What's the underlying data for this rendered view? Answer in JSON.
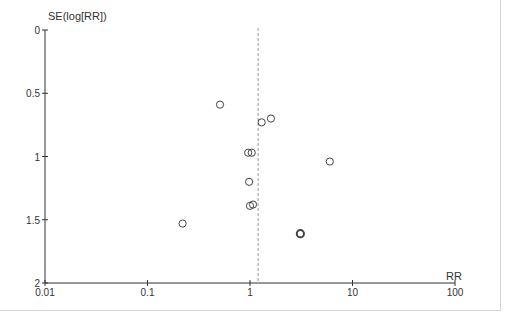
{
  "chart_data": {
    "type": "scatter",
    "subtype": "funnel_plot",
    "title": "",
    "xlabel": "RR",
    "ylabel": "SE(log[RR])",
    "xscale": "log",
    "xlim": [
      0.01,
      100
    ],
    "ylim": [
      2,
      0
    ],
    "y_inverted": true,
    "xticks": [
      0.01,
      0.1,
      1,
      10,
      100
    ],
    "xtick_labels": [
      "0.01",
      "0.1",
      "1",
      "10",
      "100"
    ],
    "yticks": [
      0,
      0.5,
      1,
      1.5,
      2
    ],
    "ytick_labels": [
      "0",
      "0.5",
      "1",
      "1.5",
      "2"
    ],
    "grid": false,
    "legend": null,
    "reference_line": {
      "style": "dashed",
      "x": 1.2,
      "color": "#9a9a9a"
    },
    "points": [
      {
        "x": 0.51,
        "y": 0.59
      },
      {
        "x": 1.3,
        "y": 0.73
      },
      {
        "x": 1.6,
        "y": 0.7
      },
      {
        "x": 0.96,
        "y": 0.97
      },
      {
        "x": 1.04,
        "y": 0.97
      },
      {
        "x": 6.0,
        "y": 1.04
      },
      {
        "x": 0.98,
        "y": 1.2
      },
      {
        "x": 1.0,
        "y": 1.39
      },
      {
        "x": 1.07,
        "y": 1.38
      },
      {
        "x": 0.22,
        "y": 1.53
      },
      {
        "x": 3.1,
        "y": 1.61,
        "emphasis": true
      }
    ]
  },
  "colors": {
    "axis": "#333333",
    "marker": "#444444",
    "reference": "#9a9a9a",
    "frame": "#d6d6d6"
  }
}
